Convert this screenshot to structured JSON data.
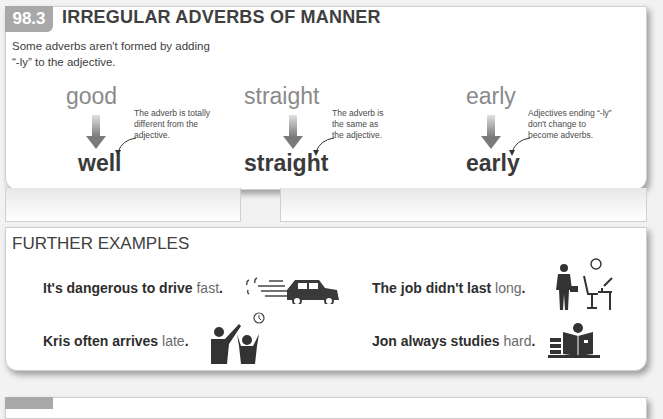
{
  "section": {
    "number": "98.3",
    "title": "IRREGULAR ADVERBS OF MANNER",
    "intro": "Some adverbs aren't formed by adding “-ly” to the adjective.",
    "accent_color": "#a8a8a8"
  },
  "columns": [
    {
      "adjective": "good",
      "adverb": "well",
      "note": "The adverb is totally different from the adjective."
    },
    {
      "adjective": "straight",
      "adverb": "straight",
      "note": "The adverb is the same as the adjective."
    },
    {
      "adjective": "early",
      "adverb": "early",
      "note": "Adjectives ending “-ly” don't change to become adverbs."
    }
  ],
  "further": {
    "title": "FURTHER EXAMPLES",
    "examples": [
      {
        "prefix": "It's dangerous to drive ",
        "adverb": "fast",
        "suffix": ".",
        "icon": "speeding-car-icon"
      },
      {
        "prefix": "The job didn't last ",
        "adverb": "long",
        "suffix": ".",
        "icon": "businessman-leaving-desk-icon"
      },
      {
        "prefix": "Kris often arrives ",
        "adverb": "late",
        "suffix": ".",
        "icon": "late-arrival-clock-icon"
      },
      {
        "prefix": "Jon always studies ",
        "adverb": "hard",
        "suffix": ".",
        "icon": "student-reading-books-icon"
      }
    ]
  }
}
